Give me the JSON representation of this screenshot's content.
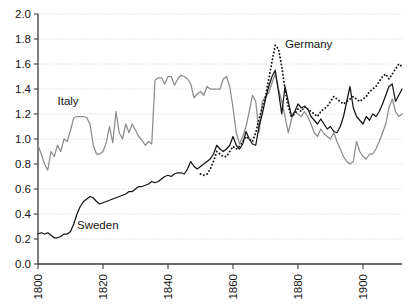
{
  "chart_data": {
    "type": "line",
    "title": "",
    "subtitle": "",
    "xlabel": "",
    "ylabel": "",
    "xlim": [
      1800,
      1912
    ],
    "ylim": [
      0.0,
      2.0
    ],
    "grid": true,
    "legend_position": "inline-annotations",
    "y_ticks": [
      "0.0",
      "0.2",
      "0.4",
      "0.6",
      "0.8",
      "1.0",
      "1.2",
      "1.4",
      "1.6",
      "1.8",
      "2.0"
    ],
    "y_tick_values": [
      0.0,
      0.2,
      0.4,
      0.6,
      0.8,
      1.0,
      1.2,
      1.4,
      1.6,
      1.8,
      2.0
    ],
    "x_ticks": [
      "1800",
      "1820",
      "1840",
      "1860",
      "1880",
      "1900"
    ],
    "x_tick_values": [
      1800,
      1820,
      1840,
      1860,
      1880,
      1900
    ],
    "annotations": [
      {
        "text": "Italy",
        "x": 1806,
        "y": 1.27
      },
      {
        "text": "Sweden",
        "x": 1812,
        "y": 0.28
      },
      {
        "text": "Germany",
        "x": 1876,
        "y": 1.73
      }
    ],
    "series": [
      {
        "name": "Italy",
        "color": "#8c8c8c",
        "style": "solid",
        "x": [
          1800,
          1801,
          1802,
          1803,
          1804,
          1805,
          1806,
          1807,
          1808,
          1809,
          1810,
          1811,
          1812,
          1813,
          1814,
          1815,
          1816,
          1817,
          1818,
          1819,
          1820,
          1821,
          1822,
          1823,
          1824,
          1825,
          1826,
          1827,
          1828,
          1829,
          1830,
          1831,
          1832,
          1833,
          1834,
          1835,
          1836,
          1837,
          1838,
          1839,
          1840,
          1841,
          1842,
          1843,
          1844,
          1845,
          1846,
          1847,
          1848,
          1849,
          1850,
          1851,
          1852,
          1853,
          1854,
          1855,
          1856,
          1857,
          1858,
          1859,
          1860,
          1861,
          1862,
          1863,
          1864,
          1865,
          1866,
          1867,
          1868,
          1869,
          1870,
          1871,
          1872,
          1873,
          1874,
          1875,
          1876,
          1877,
          1878,
          1879,
          1880,
          1881,
          1882,
          1883,
          1884,
          1885,
          1886,
          1887,
          1888,
          1889,
          1890,
          1891,
          1892,
          1893,
          1894,
          1895,
          1896,
          1897,
          1898,
          1899,
          1900,
          1901,
          1902,
          1903,
          1904,
          1905,
          1906,
          1907,
          1908,
          1909,
          1910,
          1911,
          1912
        ],
        "y": [
          0.95,
          0.88,
          0.8,
          0.75,
          0.9,
          0.86,
          0.95,
          0.9,
          1.0,
          0.98,
          1.07,
          1.17,
          1.18,
          1.18,
          1.18,
          1.17,
          1.12,
          0.95,
          0.88,
          0.88,
          0.9,
          0.97,
          1.1,
          0.97,
          1.22,
          1.05,
          1.0,
          1.12,
          1.05,
          1.12,
          1.07,
          1.02,
          0.99,
          0.95,
          0.98,
          0.96,
          1.47,
          1.49,
          1.49,
          1.44,
          1.5,
          1.5,
          1.43,
          1.48,
          1.51,
          1.5,
          1.48,
          1.44,
          1.33,
          1.36,
          1.38,
          1.35,
          1.42,
          1.4,
          1.4,
          1.4,
          1.4,
          1.48,
          1.5,
          1.42,
          1.25,
          1.05,
          0.96,
          1.02,
          1.1,
          1.22,
          1.35,
          1.3,
          1.05,
          1.3,
          1.34,
          1.37,
          1.45,
          1.52,
          1.4,
          1.3,
          1.18,
          1.05,
          1.16,
          1.22,
          1.2,
          1.18,
          1.22,
          1.18,
          1.12,
          1.05,
          1.02,
          1.08,
          1.04,
          1.02,
          1.0,
          1.05,
          0.98,
          0.92,
          0.86,
          0.82,
          0.8,
          0.82,
          0.98,
          0.9,
          0.86,
          0.84,
          0.88,
          0.88,
          0.92,
          0.98,
          1.05,
          1.12,
          1.25,
          1.32,
          1.22,
          1.18,
          1.2
        ]
      },
      {
        "name": "Sweden",
        "color": "#141414",
        "style": "solid",
        "x": [
          1800,
          1801,
          1802,
          1803,
          1804,
          1805,
          1806,
          1807,
          1808,
          1809,
          1810,
          1811,
          1812,
          1813,
          1814,
          1815,
          1816,
          1817,
          1818,
          1819,
          1820,
          1821,
          1822,
          1823,
          1824,
          1825,
          1826,
          1827,
          1828,
          1829,
          1830,
          1831,
          1832,
          1833,
          1834,
          1835,
          1836,
          1837,
          1838,
          1839,
          1840,
          1841,
          1842,
          1843,
          1844,
          1845,
          1846,
          1847,
          1848,
          1849,
          1850,
          1851,
          1852,
          1853,
          1854,
          1855,
          1856,
          1857,
          1858,
          1859,
          1860,
          1861,
          1862,
          1863,
          1864,
          1865,
          1866,
          1867,
          1868,
          1869,
          1870,
          1871,
          1872,
          1873,
          1874,
          1875,
          1876,
          1877,
          1878,
          1879,
          1880,
          1881,
          1882,
          1883,
          1884,
          1885,
          1886,
          1887,
          1888,
          1889,
          1890,
          1891,
          1892,
          1893,
          1894,
          1895,
          1896,
          1897,
          1898,
          1899,
          1900,
          1901,
          1902,
          1903,
          1904,
          1905,
          1906,
          1907,
          1908,
          1909,
          1910,
          1911,
          1912
        ],
        "y": [
          0.24,
          0.25,
          0.24,
          0.25,
          0.23,
          0.21,
          0.21,
          0.22,
          0.24,
          0.24,
          0.26,
          0.32,
          0.4,
          0.46,
          0.5,
          0.52,
          0.54,
          0.53,
          0.5,
          0.48,
          0.49,
          0.5,
          0.51,
          0.52,
          0.53,
          0.54,
          0.55,
          0.56,
          0.58,
          0.58,
          0.6,
          0.62,
          0.62,
          0.63,
          0.64,
          0.66,
          0.65,
          0.66,
          0.68,
          0.7,
          0.71,
          0.7,
          0.72,
          0.73,
          0.73,
          0.72,
          0.76,
          0.82,
          0.78,
          0.76,
          0.78,
          0.8,
          0.82,
          0.84,
          0.88,
          0.95,
          0.92,
          0.9,
          0.92,
          0.95,
          1.02,
          0.95,
          0.92,
          0.96,
          1.06,
          1.0,
          0.96,
          0.95,
          1.1,
          1.2,
          1.32,
          1.42,
          1.5,
          1.55,
          1.38,
          1.2,
          1.42,
          1.3,
          1.18,
          1.22,
          1.28,
          1.25,
          1.26,
          1.24,
          1.18,
          1.15,
          1.12,
          1.16,
          1.12,
          1.08,
          1.1,
          1.06,
          1.05,
          1.1,
          1.18,
          1.3,
          1.42,
          1.25,
          1.18,
          1.15,
          1.12,
          1.18,
          1.15,
          1.2,
          1.18,
          1.22,
          1.28,
          1.35,
          1.42,
          1.44,
          1.3,
          1.35,
          1.4
        ]
      },
      {
        "name": "Germany",
        "color": "#141414",
        "style": "dotted",
        "x": [
          1850,
          1851,
          1852,
          1853,
          1854,
          1855,
          1856,
          1857,
          1858,
          1859,
          1860,
          1861,
          1862,
          1863,
          1864,
          1865,
          1866,
          1867,
          1868,
          1869,
          1870,
          1871,
          1872,
          1873,
          1874,
          1875,
          1876,
          1877,
          1878,
          1879,
          1880,
          1881,
          1882,
          1883,
          1884,
          1885,
          1886,
          1887,
          1888,
          1889,
          1890,
          1891,
          1892,
          1893,
          1894,
          1895,
          1896,
          1897,
          1898,
          1899,
          1900,
          1901,
          1902,
          1903,
          1904,
          1905,
          1906,
          1907,
          1908,
          1909,
          1910,
          1911,
          1912
        ],
        "y": [
          0.72,
          0.71,
          0.72,
          0.76,
          0.82,
          0.9,
          0.88,
          0.86,
          0.86,
          0.9,
          0.94,
          0.92,
          0.94,
          0.98,
          1.02,
          1.0,
          0.98,
          1.05,
          1.16,
          1.25,
          1.34,
          1.48,
          1.62,
          1.75,
          1.72,
          1.58,
          1.4,
          1.26,
          1.18,
          1.2,
          1.24,
          1.22,
          1.26,
          1.24,
          1.22,
          1.2,
          1.18,
          1.22,
          1.24,
          1.26,
          1.3,
          1.34,
          1.32,
          1.3,
          1.28,
          1.3,
          1.32,
          1.34,
          1.32,
          1.3,
          1.32,
          1.34,
          1.38,
          1.4,
          1.42,
          1.46,
          1.5,
          1.52,
          1.48,
          1.52,
          1.56,
          1.6,
          1.58
        ]
      }
    ]
  }
}
